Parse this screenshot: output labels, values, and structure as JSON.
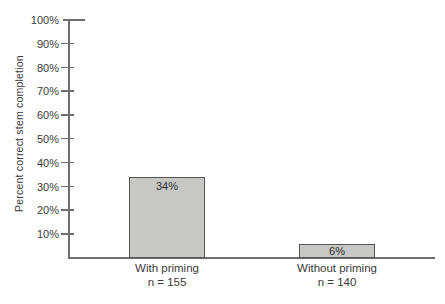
{
  "chart_data": {
    "type": "bar",
    "title": "",
    "ylabel": "Percent correct stem completion",
    "xlabel": "",
    "categories": [
      "With priming",
      "Without priming"
    ],
    "sample_labels": [
      "n = 155",
      "n = 140"
    ],
    "values": [
      34,
      6
    ],
    "bar_labels": [
      "34%",
      "6%"
    ],
    "ylim": [
      0,
      100
    ],
    "ytick_step": 10,
    "yticks": [
      "100%",
      "90%",
      "80%",
      "70%",
      "60%",
      "50%",
      "40%",
      "30%",
      "20%",
      "10%"
    ],
    "grid": false,
    "legend_position": "none",
    "colors": {
      "bar_fill": "#c7c8c5",
      "bar_border": "#555555",
      "axis": "#6e6e6e",
      "text": "#3a3a3a"
    }
  }
}
